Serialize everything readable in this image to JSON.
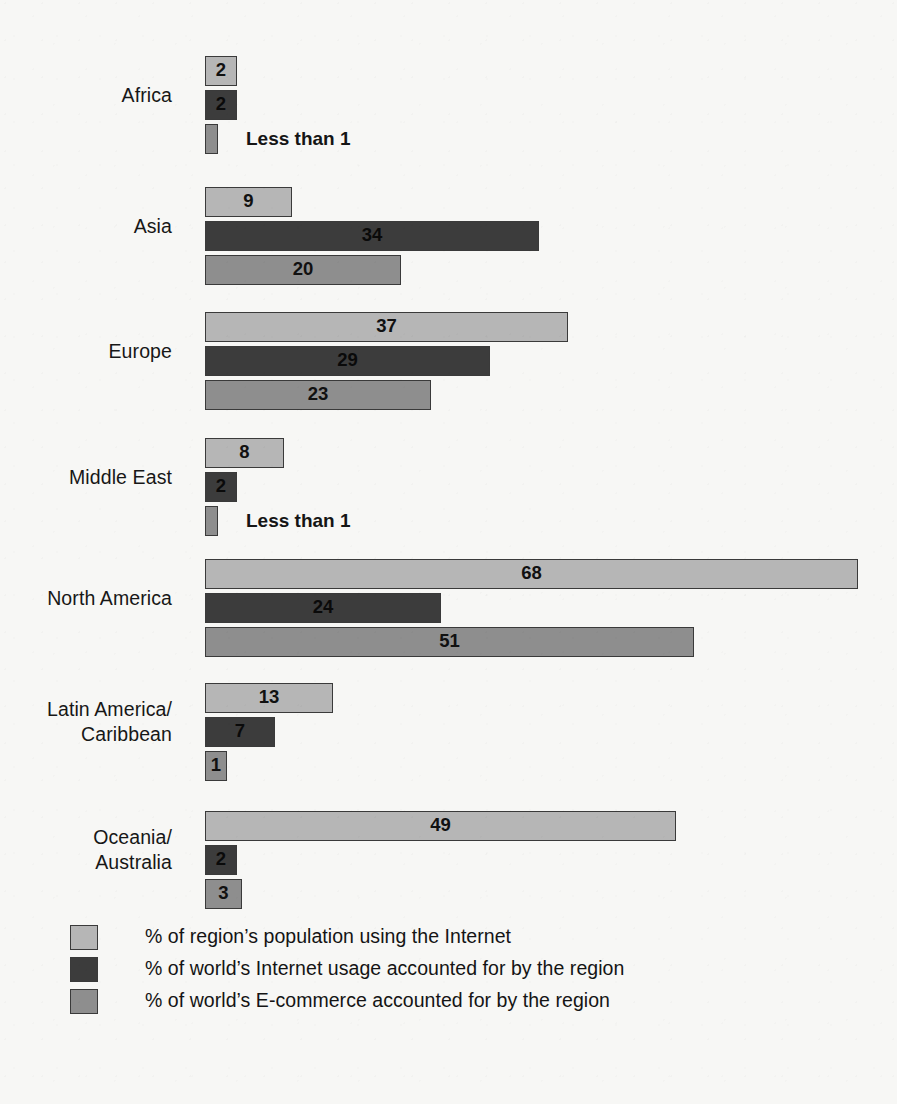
{
  "chart_data": {
    "type": "bar",
    "orientation": "horizontal",
    "title": "",
    "subtitle": "",
    "xlabel": "",
    "ylabel": "",
    "xlim": [
      0,
      72
    ],
    "grid": false,
    "legend_position": "bottom-left",
    "pixels_per_unit": 9.6,
    "bar_origin_x": 205,
    "categories": [
      "Africa",
      "Asia",
      "Europe",
      "Middle East",
      "North America",
      "Latin America/\nCaribbean",
      "Oceania/\nAustralia"
    ],
    "series": [
      {
        "name": "% of region's population using the Internet",
        "color": "#b6b6b6",
        "values": [
          2,
          9,
          37,
          8,
          68,
          13,
          49
        ],
        "labels": [
          "2",
          "9",
          "37",
          "8",
          "68",
          "13",
          "49"
        ]
      },
      {
        "name": "% of world's Internet usage accounted for by the region",
        "color": "#3c3c3c",
        "values": [
          2,
          34,
          29,
          2,
          24,
          7,
          2
        ],
        "labels": [
          "2",
          "34",
          "29",
          "2",
          "24",
          "7",
          "2"
        ]
      },
      {
        "name": "% of world's E-commerce accounted for by the region",
        "color": "#8e8e8e",
        "values": [
          0.5,
          20,
          23,
          0.5,
          51,
          1,
          3
        ],
        "labels": [
          "Less than 1",
          "20",
          "23",
          "Less than 1",
          "51",
          "1",
          "3"
        ]
      }
    ],
    "annotations": [
      {
        "category": "Africa",
        "series": "% of world's E-commerce accounted for by the region",
        "text": "Less than 1"
      },
      {
        "category": "Middle East",
        "series": "% of world's E-commerce accounted for by the region",
        "text": "Less than 1"
      }
    ]
  },
  "groups": [
    {
      "label": "Africa",
      "top": 56,
      "bars": [
        {
          "series": 0,
          "value": 2,
          "width": 32,
          "label": "2",
          "tiny": false,
          "note": ""
        },
        {
          "series": 1,
          "value": 2,
          "width": 32,
          "label": "2",
          "tiny": false,
          "note": ""
        },
        {
          "series": 2,
          "value": 0.5,
          "width": 13,
          "label": "",
          "tiny": true,
          "note": "Less than 1"
        }
      ]
    },
    {
      "label": "Asia",
      "top": 187,
      "bars": [
        {
          "series": 0,
          "value": 9,
          "width": 87,
          "label": "9",
          "tiny": false,
          "note": ""
        },
        {
          "series": 1,
          "value": 34,
          "width": 334,
          "label": "34",
          "tiny": false,
          "note": ""
        },
        {
          "series": 2,
          "value": 20,
          "width": 196,
          "label": "20",
          "tiny": false,
          "note": ""
        }
      ]
    },
    {
      "label": "Europe",
      "top": 312,
      "bars": [
        {
          "series": 0,
          "value": 37,
          "width": 363,
          "label": "37",
          "tiny": false,
          "note": ""
        },
        {
          "series": 1,
          "value": 29,
          "width": 285,
          "label": "29",
          "tiny": false,
          "note": ""
        },
        {
          "series": 2,
          "value": 23,
          "width": 226,
          "label": "23",
          "tiny": false,
          "note": ""
        }
      ]
    },
    {
      "label": "Middle East",
      "top": 438,
      "bars": [
        {
          "series": 0,
          "value": 8,
          "width": 79,
          "label": "8",
          "tiny": false,
          "note": ""
        },
        {
          "series": 1,
          "value": 2,
          "width": 32,
          "label": "2",
          "tiny": false,
          "note": ""
        },
        {
          "series": 2,
          "value": 0.5,
          "width": 13,
          "label": "",
          "tiny": true,
          "note": "Less than 1"
        }
      ]
    },
    {
      "label": "North America",
      "top": 559,
      "bars": [
        {
          "series": 0,
          "value": 68,
          "width": 653,
          "label": "68",
          "tiny": false,
          "note": ""
        },
        {
          "series": 1,
          "value": 24,
          "width": 236,
          "label": "24",
          "tiny": false,
          "note": ""
        },
        {
          "series": 2,
          "value": 51,
          "width": 489,
          "label": "51",
          "tiny": false,
          "note": ""
        }
      ]
    },
    {
      "label": "Latin America/\nCaribbean",
      "top": 683,
      "bars": [
        {
          "series": 0,
          "value": 13,
          "width": 128,
          "label": "13",
          "tiny": false,
          "note": ""
        },
        {
          "series": 1,
          "value": 7,
          "width": 70,
          "label": "7",
          "tiny": false,
          "note": ""
        },
        {
          "series": 2,
          "value": 1,
          "width": 22,
          "label": "1",
          "tiny": false,
          "note": ""
        }
      ]
    },
    {
      "label": "Oceania/\nAustralia",
      "top": 811,
      "bars": [
        {
          "series": 0,
          "value": 49,
          "width": 471,
          "label": "49",
          "tiny": false,
          "note": ""
        },
        {
          "series": 1,
          "value": 2,
          "width": 32,
          "label": "2",
          "tiny": false,
          "note": ""
        },
        {
          "series": 2,
          "value": 3,
          "width": 37,
          "label": "3",
          "tiny": false,
          "note": ""
        }
      ]
    }
  ],
  "legend": {
    "items": [
      {
        "series": 0,
        "color": "#b6b6b6",
        "text": "% of region’s population using the Internet"
      },
      {
        "series": 1,
        "color": "#3c3c3c",
        "text": "% of world’s Internet usage accounted for by the region"
      },
      {
        "series": 2,
        "color": "#8e8e8e",
        "text": "% of world’s E-commerce accounted for by the region"
      }
    ]
  },
  "colors": {
    "background": "#f7f7f5",
    "series_0": "#b6b6b6",
    "series_1": "#3c3c3c",
    "series_2": "#8e8e8e",
    "bar_outline": "#3a3a3a",
    "text": "#1b1b1b"
  }
}
